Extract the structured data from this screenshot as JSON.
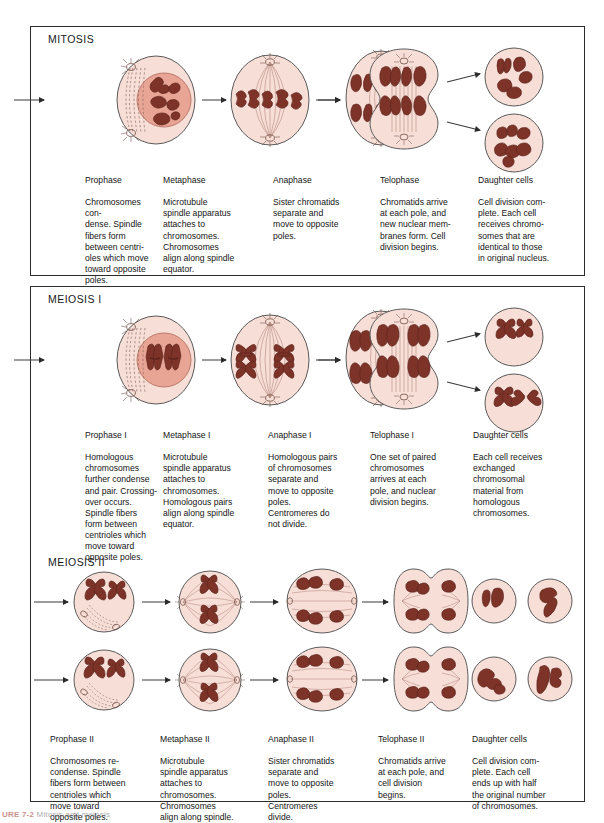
{
  "figure": {
    "caption_number": "URE 7-2",
    "caption_text": "Mitosis and meiosis"
  },
  "colors": {
    "cytoplasm": "#f7ded7",
    "cytoplasm_dark": "#edbfb5",
    "nucleus": "#e8a596",
    "chromosome": "#7d3328",
    "chromosome_light": "#9c4636",
    "outline": "#4a4a4a",
    "arrow": "#2b2b2b",
    "frame": "#2b2b2b"
  },
  "sections": [
    {
      "id": "mitosis",
      "title": "MITOSIS",
      "stages": [
        {
          "name": "Prophase",
          "text": "Chromosomes con-\ndense. Spindle\nfibers form\nbetween centri-\noles which move\ntoward opposite\npoles."
        },
        {
          "name": "Metaphase",
          "text": "Microtubule\nspindle apparatus\nattaches to\nchromosomes.\nChromosomes\nalign along spindle\nequator."
        },
        {
          "name": "Anaphase",
          "text": "Sister chromatids\nseparate and\nmove to opposite\npoles."
        },
        {
          "name": "Telophase",
          "text": "Chromatids arrive\nat each pole, and\nnew nuclear mem-\nbranes form. Cell\ndivision begins."
        },
        {
          "name": "Daughter cells",
          "text": "Cell division com-\nplete. Each cell\nreceives chromo-\nsomes that are\nidentical to those\nin original nucleus."
        }
      ]
    },
    {
      "id": "meiosis-i",
      "title": "MEIOSIS I",
      "stages": [
        {
          "name": "Prophase I",
          "text": "Homologous\nchromosomes\nfurther condense\nand pair. Crossing-\nover occurs.\nSpindle fibers\nform between\ncentrioles which\nmove toward\nopposite poles."
        },
        {
          "name": "Metaphase I",
          "text": "Microtubule\nspindle apparatus\nattaches to\nchromosomes.\nHomologous pairs\nalign along spindle\nequator."
        },
        {
          "name": "Anaphase I",
          "text": "Homologous pairs\nof chromosomes\nseparate and\nmove to opposite\npoles.\nCentromeres do\nnot divide."
        },
        {
          "name": "Telophase I",
          "text": "One set of paired\nchromosomes\narrives at each\npole, and nuclear\ndivision begins."
        },
        {
          "name": "Daughter cells",
          "text": "Each cell receives\nexchanged\nchromosomal\nmaterial from\nhomologous\nchromosomes."
        }
      ]
    },
    {
      "id": "meiosis-ii",
      "title": "MEIOSIS II",
      "stages": [
        {
          "name": "Prophase II",
          "text": "Chromosomes re-\ncondense. Spindle\nfibers form between\ncentrioles which\nmove toward\nopposite poles."
        },
        {
          "name": "Metaphase II",
          "text": "Microtubule\nspindle apparatus\nattaches to\nchromosomes.\nChromosomes\nalign along spindle."
        },
        {
          "name": "Anaphase II",
          "text": "Sister chromatids\nseparate and\nmove to opposite\npoles.\nCentromeres\ndivide."
        },
        {
          "name": "Telophase II",
          "text": "Chromatids arrive\nat each pole, and\ncell division\nbegins."
        },
        {
          "name": "Daughter cells",
          "text": "Cell division com-\nplete. Each cell\nends up with half\nthe original number\nof chromosomes."
        }
      ]
    }
  ]
}
